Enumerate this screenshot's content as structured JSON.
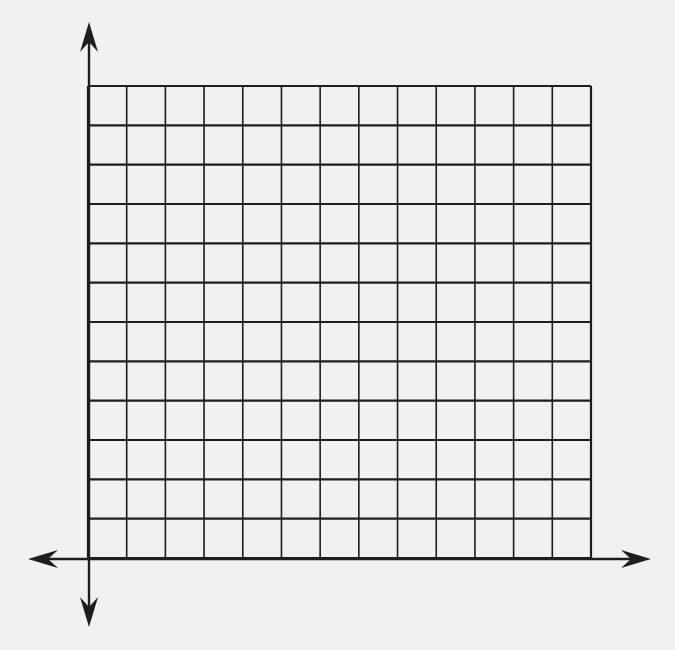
{
  "diagram": {
    "type": "coordinate-grid",
    "background": "#f1f1f0",
    "line_color": "#1e1e1e",
    "grid": {
      "left": 88,
      "top": 86,
      "right": 591,
      "bottom": 558,
      "columns": 13,
      "rows": 12
    },
    "axes": {
      "x_axis": {
        "y": 559,
        "from": 28,
        "to": 651,
        "arrows": [
          "left",
          "right"
        ]
      },
      "y_axis": {
        "x": 89,
        "from": 22,
        "to": 627,
        "arrows": [
          "up",
          "down"
        ]
      }
    },
    "labels": []
  }
}
